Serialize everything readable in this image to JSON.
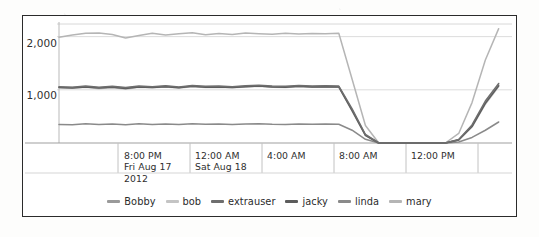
{
  "chart_data": {
    "type": "line",
    "title": "",
    "xlabel": "",
    "ylabel": "",
    "grid": true,
    "legend_position": "bottom",
    "ylim": [
      0,
      2200
    ],
    "yticks": [
      1000,
      2000
    ],
    "ytick_labels": [
      "1,000",
      "2,000"
    ],
    "xtick_labels": [
      {
        "time": "8:00 PM",
        "date": "Fri Aug 17",
        "year": "2012"
      },
      {
        "time": "12:00 AM",
        "date": "Sat Aug 18",
        "year": ""
      },
      {
        "time": "4:00 AM",
        "date": "",
        "year": ""
      },
      {
        "time": "8:00 AM",
        "date": "",
        "year": ""
      },
      {
        "time": "12:00 PM",
        "date": "",
        "year": ""
      }
    ],
    "x": [
      0,
      1,
      2,
      3,
      4,
      5,
      6,
      7,
      8,
      9,
      10,
      11,
      12,
      13,
      14,
      15,
      16,
      17,
      18,
      19,
      20,
      21,
      22,
      23,
      24,
      25,
      26,
      27,
      28,
      29,
      30,
      31,
      32,
      33,
      34
    ],
    "series": [
      {
        "name": "Bobby",
        "color": "#9a9a9a",
        "values": [
          1050,
          1045,
          1060,
          1040,
          1055,
          1035,
          1060,
          1050,
          1065,
          1045,
          1070,
          1055,
          1060,
          1050,
          1065,
          1075,
          1060,
          1055,
          1070,
          1060,
          1065,
          1060,
          620,
          150,
          0,
          0,
          0,
          0,
          0,
          0,
          60,
          320,
          760,
          1090,
          null
        ]
      },
      {
        "name": "bob",
        "color": "#c4c4c4",
        "values": [
          1040,
          1030,
          1050,
          1020,
          1045,
          1010,
          1050,
          1040,
          1055,
          1035,
          1060,
          1045,
          1050,
          1040,
          1055,
          1065,
          1050,
          1045,
          1060,
          1050,
          1055,
          1050,
          600,
          140,
          0,
          0,
          0,
          0,
          0,
          0,
          55,
          300,
          730,
          1060,
          null
        ]
      },
      {
        "name": "extrauser",
        "color": "#6e6e6e",
        "values": [
          1060,
          1050,
          1070,
          1050,
          1065,
          1045,
          1070,
          1060,
          1075,
          1055,
          1080,
          1065,
          1070,
          1060,
          1075,
          1085,
          1070,
          1065,
          1080,
          1070,
          1075,
          1070,
          640,
          160,
          0,
          0,
          0,
          0,
          0,
          0,
          65,
          340,
          790,
          1120,
          null
        ]
      },
      {
        "name": "jacky",
        "color": "#5c5c5c",
        "values": [
          1045,
          1035,
          1055,
          1035,
          1050,
          1025,
          1055,
          1045,
          1060,
          1040,
          1065,
          1050,
          1055,
          1045,
          1060,
          1070,
          1055,
          1050,
          1065,
          1055,
          1060,
          1055,
          610,
          145,
          0,
          0,
          0,
          0,
          0,
          0,
          58,
          310,
          745,
          1075,
          null
        ]
      },
      {
        "name": "linda",
        "color": "#8a8a8a",
        "values": [
          350,
          345,
          360,
          350,
          355,
          345,
          360,
          350,
          358,
          348,
          362,
          352,
          356,
          350,
          358,
          362,
          352,
          350,
          356,
          352,
          356,
          352,
          240,
          70,
          0,
          0,
          0,
          0,
          0,
          0,
          20,
          105,
          240,
          395,
          null
        ]
      },
      {
        "name": "mary",
        "color": "#b5b5b5",
        "values": [
          1990,
          2030,
          2065,
          2070,
          2040,
          1975,
          2020,
          2065,
          2030,
          2055,
          2075,
          2035,
          2060,
          2040,
          2070,
          2055,
          2045,
          2065,
          2050,
          2060,
          2055,
          2065,
          1200,
          330,
          0,
          0,
          0,
          0,
          0,
          0,
          180,
          760,
          1560,
          2150,
          null
        ]
      }
    ]
  },
  "legend": {
    "entries": [
      {
        "label": "Bobby",
        "color": "#9a9a9a"
      },
      {
        "label": "bob",
        "color": "#c4c4c4"
      },
      {
        "label": "extrauser",
        "color": "#6e6e6e"
      },
      {
        "label": "jacky",
        "color": "#5c5c5c"
      },
      {
        "label": "linda",
        "color": "#8a8a8a"
      },
      {
        "label": "mary",
        "color": "#b5b5b5"
      }
    ]
  },
  "axis": {
    "y_labels": [
      "2,000",
      "1,000"
    ],
    "x_ticks": [
      {
        "time": "8:00 PM",
        "date": "Fri Aug 17",
        "year": "2012"
      },
      {
        "time": "12:00 AM",
        "date": "Sat Aug 18",
        "year": ""
      },
      {
        "time": "4:00 AM",
        "date": "",
        "year": ""
      },
      {
        "time": "8:00 AM",
        "date": "",
        "year": ""
      },
      {
        "time": "12:00 PM",
        "date": "",
        "year": ""
      }
    ]
  }
}
